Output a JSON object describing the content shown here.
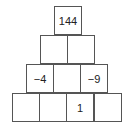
{
  "pyramid": {
    "rows": [
      [
        "144"
      ],
      [
        "",
        ""
      ],
      [
        "−4",
        "",
        "−9"
      ],
      [
        "",
        "",
        "1",
        ""
      ]
    ]
  }
}
